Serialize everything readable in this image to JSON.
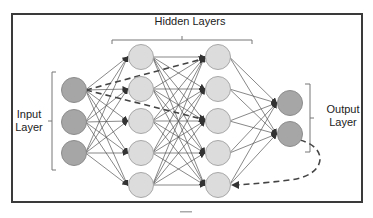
{
  "diagram": {
    "title": "Hidden Layers",
    "input_label_line1": "Input",
    "input_label_line2": "Layer",
    "output_label_line1": "Output",
    "output_label_line2": "Layer",
    "colors": {
      "frame": "#3a3a3a",
      "input_node_fill": "#a6a6a6",
      "input_node_stroke": "#8c8c8c",
      "hidden_node_fill": "#dcdcdc",
      "hidden_node_stroke": "#a8a8a8",
      "output_node_fill": "#a6a6a6",
      "edge": "#555555",
      "dashed": "#444444",
      "bracket": "#777777"
    },
    "layers": {
      "input": {
        "count": 3
      },
      "hidden1": {
        "count": 5
      },
      "hidden2": {
        "count": 5
      },
      "output": {
        "count": 2
      }
    },
    "dashed_arrows": [
      {
        "from": "input-node-1",
        "to": "hidden2-node-1"
      },
      {
        "from": "input-node-1",
        "to": "hidden2-node-3"
      },
      {
        "from": "output-node-2",
        "to": "hidden2-node-5",
        "curved": true
      }
    ]
  }
}
